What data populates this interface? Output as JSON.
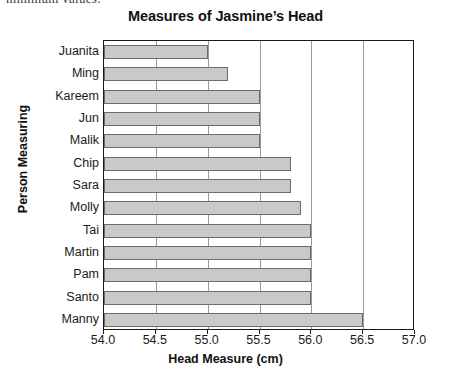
{
  "page": {
    "clipped_text_fragment": "minimum values."
  },
  "chart_data": {
    "type": "bar",
    "orientation": "horizontal",
    "title": "Measures of Jasmine’s Head",
    "xlabel": "Head Measure (cm)",
    "ylabel": "Person Measuring",
    "categories": [
      "Juanita",
      "Ming",
      "Kareem",
      "Jun",
      "Malik",
      "Chip",
      "Sara",
      "Molly",
      "Tai",
      "Martin",
      "Pam",
      "Santo",
      "Manny"
    ],
    "values": [
      55.0,
      55.2,
      55.5,
      55.5,
      55.5,
      55.8,
      55.8,
      55.9,
      56.0,
      56.0,
      56.0,
      56.0,
      56.5
    ],
    "xlim": [
      54.0,
      57.0
    ],
    "xticks": [
      "54.0",
      "54.5",
      "55.0",
      "55.5",
      "56.0",
      "56.5",
      "57.0"
    ],
    "xtick_values": [
      54.0,
      54.5,
      55.0,
      55.5,
      56.0,
      56.5,
      57.0
    ],
    "grid": "vertical",
    "legend": "none",
    "bar_fill_color": "#c9c9c9",
    "bar_edge_color": "#6b6b6b",
    "frame_color": "#1a1a1a",
    "gridline_color": "#9a9a9a"
  }
}
